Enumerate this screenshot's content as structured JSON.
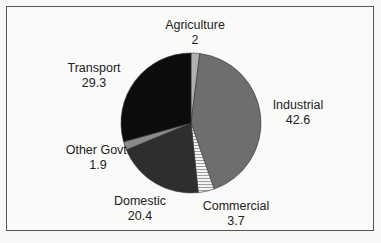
{
  "chart_data": {
    "type": "pie",
    "title": "",
    "categories": [
      "Agriculture",
      "Industrial",
      "Commercial",
      "Domestic",
      "Other Govt.",
      "Transport"
    ],
    "values": [
      2,
      42.6,
      3.7,
      20.4,
      1.9,
      29.3
    ],
    "value_labels": [
      "2",
      "42.6",
      "3.7",
      "20.4",
      "1.9",
      "29.3"
    ],
    "colors": [
      "#b0b0b0",
      "#6e6e6e",
      "hatched-white",
      "#2e2e2e",
      "#8a8a8a",
      "#0c0c0c"
    ],
    "start_angle": "12 o'clock, clockwise",
    "legend": "none (direct labels)"
  },
  "labels": {
    "agriculture": {
      "name": "Agriculture",
      "value": "2"
    },
    "industrial": {
      "name": "Industrial",
      "value": "42.6"
    },
    "commercial": {
      "name": "Commercial",
      "value": "3.7"
    },
    "domestic": {
      "name": "Domestic",
      "value": "20.4"
    },
    "other_govt": {
      "name": "Other Govt.",
      "value": "1.9"
    },
    "transport": {
      "name": "Transport",
      "value": "29.3"
    }
  }
}
